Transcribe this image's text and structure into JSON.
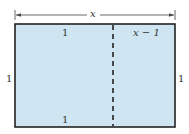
{
  "diagram": {
    "type": "golden-rectangle",
    "top_dimension": "x",
    "left_side": "1",
    "right_side": "1",
    "left_square_top": "1",
    "left_square_bottom": "1",
    "right_part_top": "x − 1",
    "colors": {
      "fill": "#cfe6f2",
      "border": "#222222",
      "dash": "#222222",
      "arrow": "#444444"
    }
  }
}
